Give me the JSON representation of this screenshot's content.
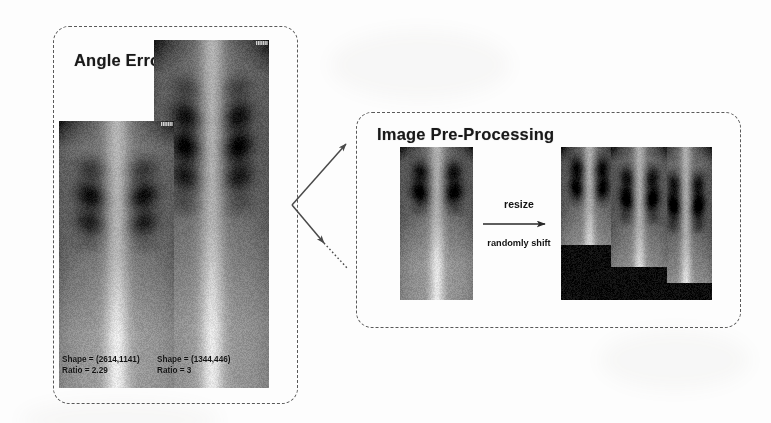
{
  "figure": {
    "background_color": "#ffffff",
    "stroke_color": "#5a5a5a"
  },
  "panels": [
    {
      "id": "angle-error",
      "title": "Angle Error",
      "border_style": "dashed-rounded",
      "images": [
        {
          "name": "chest-xray-wide",
          "caption_shape": "Shape = (2614,1141)",
          "caption_ratio": "Ratio = 2.29"
        },
        {
          "name": "chest-xray-tall",
          "caption_shape": "Shape = (1344,446)",
          "caption_ratio": "Ratio = 3"
        }
      ]
    },
    {
      "id": "preprocessing",
      "title": "Image Pre-Processing",
      "border_style": "dashed-rounded",
      "transform": {
        "label_top": "resize",
        "label_bottom": "randomly shift",
        "arrow": "right-arrow"
      },
      "images": [
        {
          "name": "source-xray"
        },
        {
          "name": "shifted-xray-1"
        },
        {
          "name": "shifted-xray-2"
        },
        {
          "name": "shifted-xray-3"
        }
      ]
    }
  ],
  "connectors": [
    {
      "name": "branch-arrow-upper",
      "style": "solid",
      "direction": "up-right"
    },
    {
      "name": "branch-arrow-lower",
      "style": "dotted",
      "direction": "down-right"
    }
  ]
}
